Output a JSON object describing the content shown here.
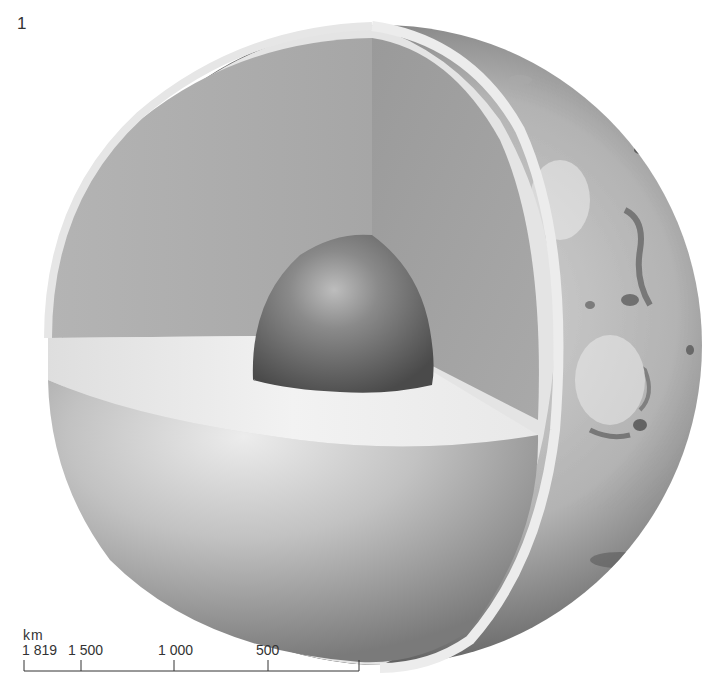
{
  "figure": {
    "number": "1",
    "layers": [
      {
        "name": "core",
        "color": "#5e5e5e"
      },
      {
        "name": "mantle",
        "color": "#a9a9a9"
      },
      {
        "name": "crust",
        "color": "#e2e2e2"
      },
      {
        "name": "surface",
        "color": "#8a8a8a"
      }
    ]
  },
  "scale_bar": {
    "unit": "km",
    "ticks": [
      {
        "label": "1 819",
        "value": 1819
      },
      {
        "label": "1 500",
        "value": 1500
      },
      {
        "label": "1 000",
        "value": 1000
      },
      {
        "label": "500",
        "value": 500
      },
      {
        "label": "",
        "value": 0
      }
    ]
  }
}
